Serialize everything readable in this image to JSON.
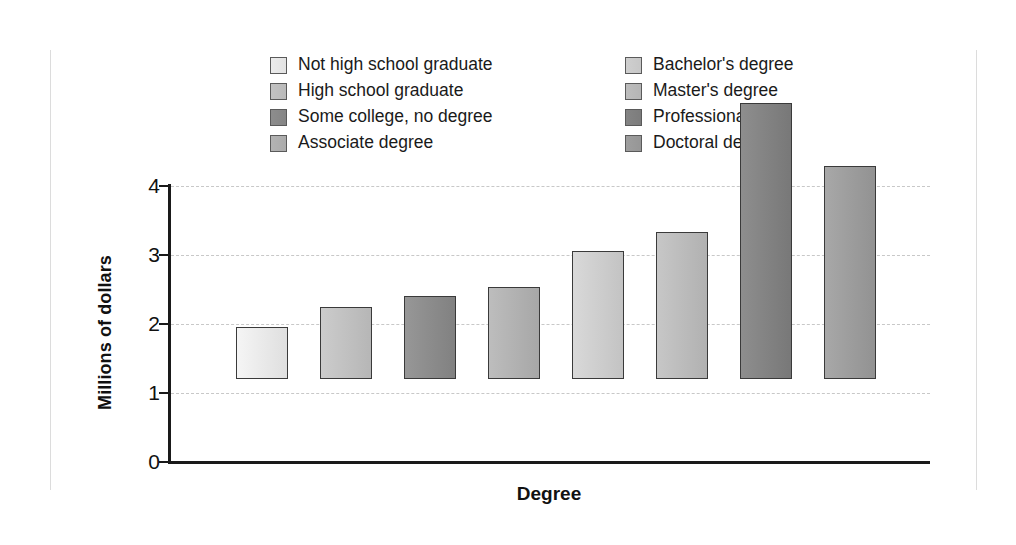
{
  "figure": {
    "background": "#ffffff",
    "axis_color": "#1a1a1a",
    "grid_color": "#c8c8c8"
  },
  "legend": {
    "columns": [
      {
        "items": [
          0,
          1,
          2,
          3
        ]
      },
      {
        "items": [
          4,
          5,
          6,
          7
        ]
      }
    ]
  },
  "chart_data": {
    "type": "bar",
    "title": "",
    "xlabel": "Degree",
    "ylabel": "Millions of dollars",
    "ylim": [
      0,
      4
    ],
    "yticks": [
      "0",
      "1",
      "2",
      "3",
      "4"
    ],
    "ytick_values": [
      0,
      1,
      2,
      3,
      4
    ],
    "grid": true,
    "grid_axis": "y",
    "legend_position": "top",
    "categories": [
      "Not high school graduate",
      "High school graduate",
      "Some college, no degree",
      "Associate degree",
      "Bachelor's degree",
      "Master's degree",
      "Professional",
      "Doctoral degree"
    ],
    "values": [
      0.75,
      1.04,
      1.2,
      1.33,
      1.85,
      2.13,
      4.0,
      3.09
    ],
    "colors": [
      "#ebebeb",
      "#c2c2c2",
      "#8d8d8d",
      "#b3b3b3",
      "#cfcfcf",
      "#bdbdbd",
      "#848484",
      "#9e9e9e"
    ],
    "bar_edge_color": "#3a3a3a"
  }
}
